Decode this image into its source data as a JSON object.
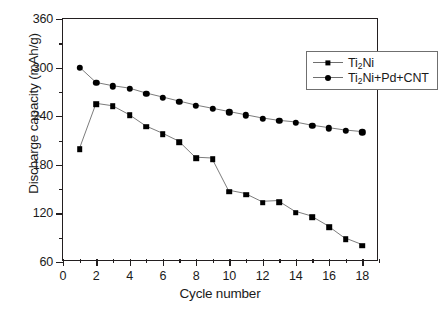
{
  "chart_data": {
    "type": "line",
    "title": "",
    "xlabel": "Cycle number",
    "ylabel": "Discharge capacity (mAh/g)",
    "xlim": [
      0,
      19
    ],
    "ylim": [
      60,
      360
    ],
    "xticks": [
      0,
      2,
      4,
      6,
      8,
      10,
      12,
      14,
      16,
      18
    ],
    "xticklabels": [
      "0",
      "2",
      "4",
      "6",
      "8",
      "10",
      "12",
      "14",
      "16",
      "18"
    ],
    "xminorticks": [
      1,
      3,
      5,
      7,
      9,
      11,
      13,
      15,
      17,
      19
    ],
    "yticks": [
      60,
      120,
      180,
      240,
      300,
      360
    ],
    "yticklabels": [
      "60",
      "120",
      "180",
      "240",
      "300",
      "360"
    ],
    "yminorticks": [
      90,
      150,
      210,
      270,
      330
    ],
    "grid": false,
    "legend_position": "upper right",
    "x": [
      1,
      2,
      3,
      4,
      5,
      6,
      7,
      8,
      9,
      10,
      11,
      12,
      13,
      14,
      15,
      16,
      17,
      18
    ],
    "series": [
      {
        "name": "Ti2Ni",
        "name_html": "Ti<sub>2</sub>Ni",
        "marker": "square",
        "color": "#000000",
        "values": [
          199,
          255,
          252,
          241,
          227,
          218,
          208,
          188,
          187,
          147,
          143,
          133,
          134,
          121,
          115,
          103,
          88,
          80
        ]
      },
      {
        "name": "Ti2Ni+Pd+CNT",
        "name_html": "Ti<sub>2</sub>Ni+Pd+CNT",
        "marker": "circle",
        "color": "#000000",
        "values": [
          300,
          281,
          277,
          274,
          268,
          263,
          258,
          253,
          249,
          245,
          241,
          237,
          234,
          232,
          228,
          225,
          222,
          220
        ]
      }
    ]
  },
  "legend": {
    "entries": [
      {
        "label_html": "Ti<sub>2</sub>Ni",
        "marker": "square"
      },
      {
        "label_html": "Ti<sub>2</sub>Ni+Pd+CNT",
        "marker": "circle"
      }
    ]
  },
  "caption": {
    "text": ""
  }
}
